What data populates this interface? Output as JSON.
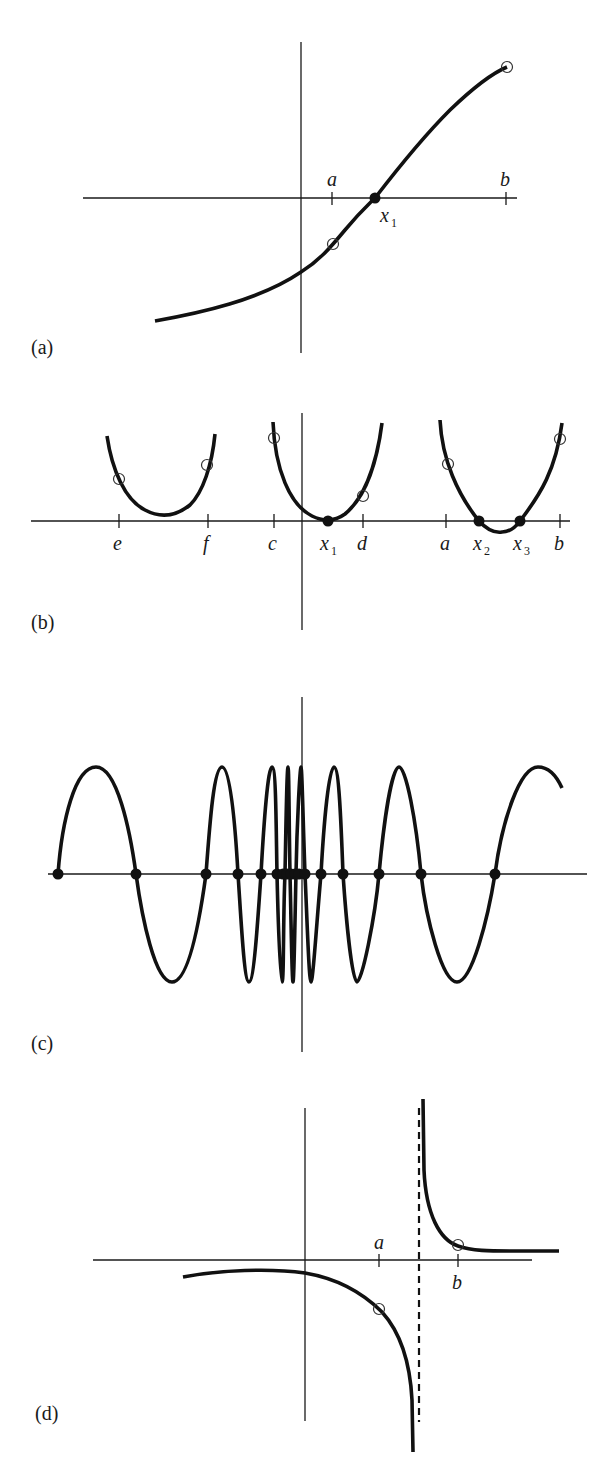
{
  "figure": {
    "panels": [
      {
        "id": "a",
        "label": "(a)",
        "ticks": [
          {
            "name": "a",
            "x": 332
          },
          {
            "name": "b",
            "x": 506
          }
        ],
        "root_labels": [
          {
            "base": "x",
            "sub": "1"
          }
        ],
        "description": "Monotone increasing curve with a single root x1 between a and b; open circles at f(a) < 0 and f(b) > 0"
      },
      {
        "id": "b",
        "label": "(b)",
        "ticks": [
          {
            "name": "e",
            "x": 119
          },
          {
            "name": "f",
            "x": 208
          },
          {
            "name": "c",
            "x": 274
          },
          {
            "name": "d",
            "x": 363
          },
          {
            "name": "a",
            "x": 446
          },
          {
            "name": "b",
            "x": 560
          }
        ],
        "root_labels": [
          {
            "base": "x",
            "sub": "1"
          },
          {
            "base": "x",
            "sub": "2"
          },
          {
            "base": "x",
            "sub": "3"
          }
        ],
        "description": "Three parabolas: one with no root on [e,f], one tangent to the axis at double root x1 on [c,d], one with two roots x2, x3 on [a,b]"
      },
      {
        "id": "c",
        "label": "(c)",
        "root_count_visible": 20,
        "description": "Oscillating function whose zeros accumulate near the origin"
      },
      {
        "id": "d",
        "label": "(d)",
        "ticks": [
          {
            "name": "a",
            "x": 380
          },
          {
            "name": "b",
            "x": 459
          }
        ],
        "description": "Function with a vertical asymptote (dashed) between a and b; sign change across the pole but no root"
      }
    ]
  },
  "labels": {
    "a_panel": "(a)",
    "b_panel": "(b)",
    "c_panel": "(c)",
    "d_panel": "(d)",
    "tick_a": "a",
    "tick_b": "b",
    "tick_c": "c",
    "tick_d": "d",
    "tick_e": "e",
    "tick_f": "f",
    "x": "x",
    "sub1": "1",
    "sub2": "2",
    "sub3": "3"
  }
}
